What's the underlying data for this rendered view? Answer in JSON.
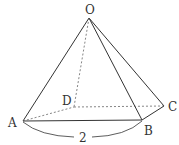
{
  "diagram": {
    "type": "square pyramid",
    "stroke_color": "#333333",
    "hidden_edge_color": "#666666",
    "vertices": {
      "O": {
        "label": "O",
        "x": 89,
        "y": 18
      },
      "A": {
        "label": "A",
        "x": 23,
        "y": 121
      },
      "B": {
        "label": "B",
        "x": 142,
        "y": 120
      },
      "C": {
        "label": "C",
        "x": 164,
        "y": 106
      },
      "D": {
        "label": "D",
        "x": 74,
        "y": 107
      }
    },
    "visible_edges": [
      "OA",
      "OB",
      "OC",
      "AB",
      "BC"
    ],
    "hidden_edges": [
      "OD",
      "AD",
      "DC"
    ],
    "dimension": {
      "between": "A-B",
      "label": "2"
    }
  }
}
